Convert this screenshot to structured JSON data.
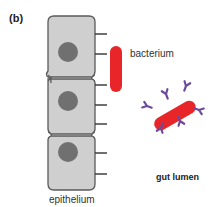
{
  "figure": {
    "panel_label": "(b)",
    "labels": {
      "bacterium": "bacterium",
      "epithelium": "epithelium",
      "gut_lumen": "gut lumen"
    },
    "colors": {
      "cell_fill": "#cfcfcf",
      "cell_stroke": "#5a5a5a",
      "nucleus": "#707070",
      "bacterium": "#e8262a",
      "antibody": "#6b4c9a",
      "microvilli": "#333333"
    },
    "cells": [
      {
        "name": "epithelial-cell-1",
        "nucleus": "nucleus-1"
      },
      {
        "name": "epithelial-cell-2",
        "nucleus": "nucleus-2"
      },
      {
        "name": "epithelial-cell-3",
        "nucleus": "nucleus-3"
      }
    ]
  }
}
